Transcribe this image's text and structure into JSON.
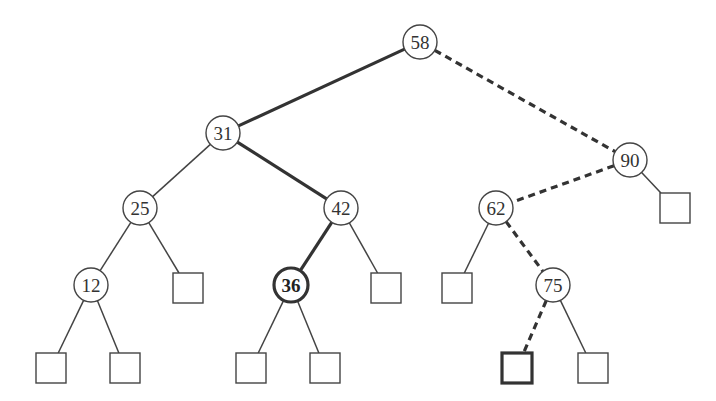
{
  "diagram": {
    "type": "binary-search-tree",
    "colors": {
      "stroke": "#444444",
      "bold_stroke": "#333333",
      "fill": "#ffffff",
      "text": "#333333"
    },
    "nodes": [
      {
        "id": "n58",
        "label": "58",
        "kind": "internal",
        "x": 420,
        "y": 42
      },
      {
        "id": "n31",
        "label": "31",
        "kind": "internal",
        "x": 223,
        "y": 133
      },
      {
        "id": "n90",
        "label": "90",
        "kind": "internal",
        "x": 630,
        "y": 160
      },
      {
        "id": "n25",
        "label": "25",
        "kind": "internal",
        "x": 140,
        "y": 208
      },
      {
        "id": "n42",
        "label": "42",
        "kind": "internal",
        "x": 341,
        "y": 208
      },
      {
        "id": "n62",
        "label": "62",
        "kind": "internal",
        "x": 496,
        "y": 208
      },
      {
        "id": "n12",
        "label": "12",
        "kind": "internal",
        "x": 91,
        "y": 285
      },
      {
        "id": "n36",
        "label": "36",
        "kind": "internal",
        "x": 291,
        "y": 285,
        "highlight": true
      },
      {
        "id": "n75",
        "label": "75",
        "kind": "internal",
        "x": 553,
        "y": 285
      },
      {
        "id": "l90r",
        "label": "",
        "kind": "external",
        "x": 675,
        "y": 208
      },
      {
        "id": "l25r",
        "label": "",
        "kind": "external",
        "x": 188,
        "y": 288
      },
      {
        "id": "l42r",
        "label": "",
        "kind": "external",
        "x": 386,
        "y": 288
      },
      {
        "id": "l62l",
        "label": "",
        "kind": "external",
        "x": 457,
        "y": 288
      },
      {
        "id": "l12l",
        "label": "",
        "kind": "external",
        "x": 51,
        "y": 368
      },
      {
        "id": "l12r",
        "label": "",
        "kind": "external",
        "x": 125,
        "y": 368
      },
      {
        "id": "l36l",
        "label": "",
        "kind": "external",
        "x": 251,
        "y": 368
      },
      {
        "id": "l36r",
        "label": "",
        "kind": "external",
        "x": 325,
        "y": 368
      },
      {
        "id": "l75l",
        "label": "",
        "kind": "external",
        "x": 517,
        "y": 368,
        "highlight": true
      },
      {
        "id": "l75r",
        "label": "",
        "kind": "external",
        "x": 593,
        "y": 368
      }
    ],
    "edges": [
      {
        "from": "n58",
        "to": "n31",
        "style": "bold"
      },
      {
        "from": "n58",
        "to": "n90",
        "style": "dashed"
      },
      {
        "from": "n31",
        "to": "n25",
        "style": "normal"
      },
      {
        "from": "n31",
        "to": "n42",
        "style": "bold"
      },
      {
        "from": "n90",
        "to": "n62",
        "style": "dashed"
      },
      {
        "from": "n90",
        "to": "l90r",
        "style": "normal"
      },
      {
        "from": "n25",
        "to": "n12",
        "style": "normal"
      },
      {
        "from": "n25",
        "to": "l25r",
        "style": "normal"
      },
      {
        "from": "n42",
        "to": "n36",
        "style": "bold"
      },
      {
        "from": "n42",
        "to": "l42r",
        "style": "normal"
      },
      {
        "from": "n62",
        "to": "l62l",
        "style": "normal"
      },
      {
        "from": "n62",
        "to": "n75",
        "style": "dashed"
      },
      {
        "from": "n12",
        "to": "l12l",
        "style": "normal"
      },
      {
        "from": "n12",
        "to": "l12r",
        "style": "normal"
      },
      {
        "from": "n36",
        "to": "l36l",
        "style": "normal"
      },
      {
        "from": "n36",
        "to": "l36r",
        "style": "normal"
      },
      {
        "from": "n75",
        "to": "l75l",
        "style": "dashed"
      },
      {
        "from": "n75",
        "to": "l75r",
        "style": "normal"
      }
    ]
  }
}
